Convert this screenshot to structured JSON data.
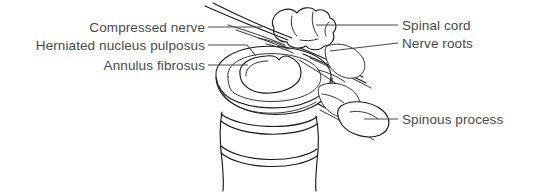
{
  "figure": {
    "kind": "anatomical-line-diagram",
    "view": "superior oblique view of vertebra and disc",
    "background_color": "#ffffff",
    "line_color": "#1a1a1a",
    "label_color": "#4a4a4a",
    "leader_color": "#4a4a4a"
  },
  "labels": {
    "left": [
      {
        "id": "compressed-nerve",
        "text": "Compressed nerve"
      },
      {
        "id": "herniated-nucleus-pulposus",
        "text": "Herniated nucleus pulposus"
      },
      {
        "id": "annulus-fibrosus",
        "text": "Annulus fibrosus"
      }
    ],
    "right": [
      {
        "id": "spinal-cord",
        "text": "Spinal cord"
      },
      {
        "id": "nerve-roots",
        "text": "Nerve roots"
      },
      {
        "id": "spinous-process",
        "text": "Spinous process"
      }
    ]
  },
  "structures": [
    {
      "id": "spinal-cord",
      "name": "Spinal cord"
    },
    {
      "id": "nerve-roots",
      "name": "Nerve roots"
    },
    {
      "id": "compressed-nerve",
      "name": "Compressed nerve"
    },
    {
      "id": "nucleus-pulposus",
      "name": "Herniated nucleus pulposus"
    },
    {
      "id": "annulus-fibrosus",
      "name": "Annulus fibrosus"
    },
    {
      "id": "spinous-process",
      "name": "Spinous process"
    },
    {
      "id": "vertebral-body",
      "name": "Vertebral body"
    },
    {
      "id": "facet-joint",
      "name": "Facet joint"
    }
  ]
}
